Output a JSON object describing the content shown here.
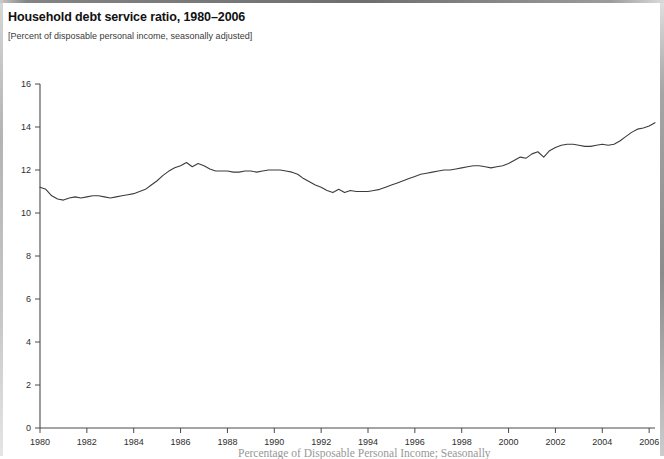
{
  "chart_data": {
    "type": "line",
    "title": "Household debt service ratio, 1980–2006",
    "subtitle": "[Percent of disposable personal income, seasonally adjusted]",
    "xlabel": "",
    "ylabel": "",
    "grid": false,
    "legend": "none",
    "xlim": [
      1980,
      2006.25
    ],
    "ylim": [
      0,
      16
    ],
    "y_ticks": [
      0,
      2,
      4,
      6,
      8,
      10,
      12,
      14,
      16
    ],
    "y_tick_labels": [
      "0",
      "2",
      "4",
      "6",
      "8",
      "10",
      "12",
      "14",
      "16"
    ],
    "x_ticks": [
      1980,
      1982,
      1984,
      1986,
      1988,
      1990,
      1992,
      1994,
      1996,
      1998,
      2000,
      2002,
      2004,
      2006
    ],
    "x_tick_labels": [
      "1980",
      "1982",
      "1984",
      "1986",
      "1988",
      "1990",
      "1992",
      "1994",
      "1996",
      "1998",
      "2000",
      "2002",
      "2004",
      "2006"
    ],
    "line_color": "#3c3c3c",
    "series": [
      {
        "name": "Household debt service ratio",
        "x": [
          1980.0,
          1980.25,
          1980.5,
          1980.75,
          1981.0,
          1981.25,
          1981.5,
          1981.75,
          1982.0,
          1982.25,
          1982.5,
          1982.75,
          1983.0,
          1983.25,
          1983.5,
          1983.75,
          1984.0,
          1984.25,
          1984.5,
          1984.75,
          1985.0,
          1985.25,
          1985.5,
          1985.75,
          1986.0,
          1986.25,
          1986.5,
          1986.75,
          1987.0,
          1987.25,
          1987.5,
          1987.75,
          1988.0,
          1988.25,
          1988.5,
          1988.75,
          1989.0,
          1989.25,
          1989.5,
          1989.75,
          1990.0,
          1990.25,
          1990.5,
          1990.75,
          1991.0,
          1991.25,
          1991.5,
          1991.75,
          1992.0,
          1992.25,
          1992.5,
          1992.75,
          1993.0,
          1993.25,
          1993.5,
          1993.75,
          1994.0,
          1994.25,
          1994.5,
          1994.75,
          1995.0,
          1995.25,
          1995.5,
          1995.75,
          1996.0,
          1996.25,
          1996.5,
          1996.75,
          1997.0,
          1997.25,
          1997.5,
          1997.75,
          1998.0,
          1998.25,
          1998.5,
          1998.75,
          1999.0,
          1999.25,
          1999.5,
          1999.75,
          2000.0,
          2000.25,
          2000.5,
          2000.75,
          2001.0,
          2001.25,
          2001.5,
          2001.75,
          2002.0,
          2002.25,
          2002.5,
          2002.75,
          2003.0,
          2003.25,
          2003.5,
          2003.75,
          2004.0,
          2004.25,
          2004.5,
          2004.75,
          2005.0,
          2005.25,
          2005.5,
          2005.75,
          2006.0,
          2006.25
        ],
        "values": [
          11.2,
          11.1,
          10.8,
          10.65,
          10.6,
          10.7,
          10.75,
          10.7,
          10.75,
          10.8,
          10.8,
          10.75,
          10.7,
          10.75,
          10.8,
          10.85,
          10.9,
          11.0,
          11.1,
          11.3,
          11.5,
          11.75,
          11.95,
          12.1,
          12.2,
          12.35,
          12.15,
          12.3,
          12.2,
          12.05,
          11.95,
          11.95,
          11.95,
          11.9,
          11.9,
          11.95,
          11.95,
          11.9,
          11.95,
          12.0,
          12.0,
          12.0,
          11.95,
          11.9,
          11.8,
          11.6,
          11.45,
          11.3,
          11.2,
          11.05,
          10.95,
          11.1,
          10.95,
          11.05,
          11.0,
          11.0,
          11.0,
          11.05,
          11.1,
          11.2,
          11.3,
          11.4,
          11.5,
          11.6,
          11.7,
          11.8,
          11.85,
          11.9,
          11.95,
          12.0,
          12.0,
          12.05,
          12.1,
          12.15,
          12.2,
          12.2,
          12.15,
          12.1,
          12.15,
          12.2,
          12.3,
          12.45,
          12.6,
          12.55,
          12.75,
          12.85,
          12.6,
          12.9,
          13.05,
          13.15,
          13.2,
          13.2,
          13.15,
          13.1,
          13.1,
          13.15,
          13.2,
          13.15,
          13.2,
          13.35,
          13.55,
          13.75,
          13.9,
          13.95,
          14.05,
          14.2
        ]
      }
    ]
  },
  "source_note": "Percentage of Disposable Personal Income; Seasonally"
}
